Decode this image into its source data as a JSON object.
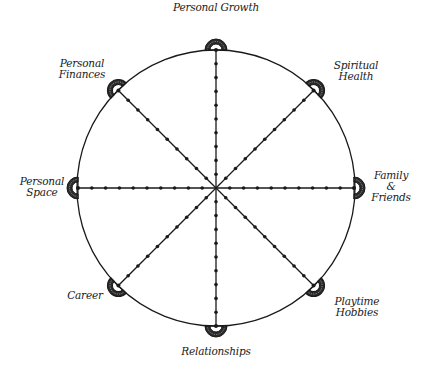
{
  "diagram": {
    "type": "wheel-of-life",
    "center": [
      216,
      188
    ],
    "radius": 138,
    "ticks_per_spoke": 9,
    "line_color": "#1a1a1a",
    "background": "#ffffff"
  },
  "categories": [
    {
      "id": "personal-growth",
      "lines": [
        "Personal Growth"
      ],
      "angle": -90
    },
    {
      "id": "spiritual-health",
      "lines": [
        "Spiritual",
        "Health"
      ],
      "angle": -45
    },
    {
      "id": "family-friends",
      "lines": [
        "Family",
        "&",
        "Friends"
      ],
      "angle": 0
    },
    {
      "id": "playtime-hobbies",
      "lines": [
        "Playtime",
        "Hobbies"
      ],
      "angle": 45
    },
    {
      "id": "relationships",
      "lines": [
        "Relationships"
      ],
      "angle": 90
    },
    {
      "id": "career",
      "lines": [
        "Career"
      ],
      "angle": 135
    },
    {
      "id": "personal-space",
      "lines": [
        "Personal",
        "Space"
      ],
      "angle": 180
    },
    {
      "id": "personal-finances",
      "lines": [
        "Personal",
        "Finances"
      ],
      "angle": -135
    }
  ]
}
